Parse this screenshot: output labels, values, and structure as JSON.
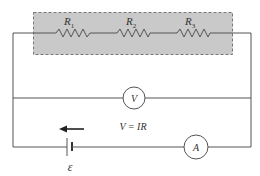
{
  "diagram": {
    "type": "circuit",
    "colors": {
      "wire": "#555555",
      "highlight_box_fill": "#c9c9c9",
      "highlight_box_border": "#777777",
      "text": "#333333"
    },
    "resistors": [
      {
        "label": "R",
        "subscript": "1"
      },
      {
        "label": "R",
        "subscript": "2"
      },
      {
        "label": "R",
        "subscript": "3"
      }
    ],
    "voltmeter": {
      "label": "V"
    },
    "ammeter": {
      "label": "A"
    },
    "equation": "V = IR",
    "battery": {
      "label": "ε",
      "current_arrow": "left-arrow"
    }
  }
}
